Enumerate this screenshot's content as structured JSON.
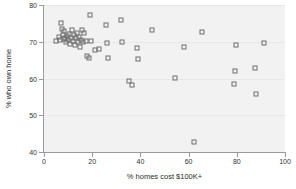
{
  "chart_data": {
    "type": "scatter",
    "title": "",
    "xlabel": "% homes cost $100K+",
    "ylabel": "% who own home",
    "xlim": [
      0,
      100
    ],
    "ylim": [
      40,
      80
    ],
    "xticks": [
      0,
      20,
      40,
      60,
      80,
      100
    ],
    "yticks": [
      40,
      50,
      60,
      70,
      80
    ],
    "grid": true,
    "legend": null,
    "marker": "open-square",
    "marker_color": "#6e6e6e",
    "plot_background": "#f2f2f2",
    "figure_background": "#ffffff",
    "points": [
      {
        "x": 5.0,
        "y": 70.1
      },
      {
        "x": 6.2,
        "y": 71.3
      },
      {
        "x": 6.6,
        "y": 70.4
      },
      {
        "x": 7.0,
        "y": 75.2
      },
      {
        "x": 7.4,
        "y": 73.4
      },
      {
        "x": 7.8,
        "y": 71.9
      },
      {
        "x": 8.1,
        "y": 70.8
      },
      {
        "x": 8.4,
        "y": 72.8
      },
      {
        "x": 8.8,
        "y": 71.1
      },
      {
        "x": 9.2,
        "y": 69.9
      },
      {
        "x": 9.6,
        "y": 71.6
      },
      {
        "x": 10.0,
        "y": 70.6
      },
      {
        "x": 10.4,
        "y": 72.2
      },
      {
        "x": 10.8,
        "y": 69.4
      },
      {
        "x": 11.2,
        "y": 71.0
      },
      {
        "x": 11.6,
        "y": 73.2
      },
      {
        "x": 12.0,
        "y": 70.2
      },
      {
        "x": 12.4,
        "y": 71.8
      },
      {
        "x": 12.8,
        "y": 69.1
      },
      {
        "x": 13.2,
        "y": 70.9
      },
      {
        "x": 13.6,
        "y": 72.4
      },
      {
        "x": 14.0,
        "y": 70.0
      },
      {
        "x": 14.4,
        "y": 71.4
      },
      {
        "x": 14.8,
        "y": 68.6
      },
      {
        "x": 15.2,
        "y": 70.5
      },
      {
        "x": 15.8,
        "y": 73.1
      },
      {
        "x": 16.2,
        "y": 69.8
      },
      {
        "x": 16.8,
        "y": 72.3
      },
      {
        "x": 17.4,
        "y": 70.3
      },
      {
        "x": 18.0,
        "y": 66.0
      },
      {
        "x": 18.6,
        "y": 65.6
      },
      {
        "x": 19.0,
        "y": 77.4
      },
      {
        "x": 19.6,
        "y": 70.1
      },
      {
        "x": 21.0,
        "y": 67.8
      },
      {
        "x": 23.0,
        "y": 68.0
      },
      {
        "x": 25.6,
        "y": 74.6
      },
      {
        "x": 26.0,
        "y": 69.7
      },
      {
        "x": 26.4,
        "y": 65.7
      },
      {
        "x": 31.8,
        "y": 75.9
      },
      {
        "x": 32.4,
        "y": 69.8
      },
      {
        "x": 35.2,
        "y": 59.2
      },
      {
        "x": 36.6,
        "y": 58.3
      },
      {
        "x": 38.4,
        "y": 68.3
      },
      {
        "x": 38.8,
        "y": 65.2
      },
      {
        "x": 44.8,
        "y": 73.3
      },
      {
        "x": 54.2,
        "y": 60.2
      },
      {
        "x": 58.0,
        "y": 68.5
      },
      {
        "x": 62.2,
        "y": 42.7
      },
      {
        "x": 65.6,
        "y": 72.6
      },
      {
        "x": 79.0,
        "y": 58.4
      },
      {
        "x": 79.4,
        "y": 62.1
      },
      {
        "x": 79.8,
        "y": 69.0
      },
      {
        "x": 87.4,
        "y": 62.8
      },
      {
        "x": 88.0,
        "y": 55.7
      },
      {
        "x": 91.4,
        "y": 69.7
      }
    ]
  }
}
